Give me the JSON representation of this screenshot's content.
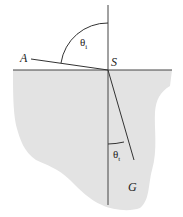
{
  "diagram": {
    "colors": {
      "background": "#ffffff",
      "medium_fill": "#e3e3e3",
      "line": "#333333",
      "text": "#222222"
    },
    "points": {
      "A": {
        "label": "A",
        "x": 30,
        "y": 58
      },
      "S": {
        "label": "S",
        "x": 108,
        "y": 70
      },
      "G": {
        "label": "G",
        "x": 134,
        "y": 165
      }
    },
    "angles": {
      "incident": {
        "symbol": "θ",
        "subscript": "i"
      },
      "transmitted": {
        "symbol": "θ",
        "subscript": "t"
      }
    }
  }
}
